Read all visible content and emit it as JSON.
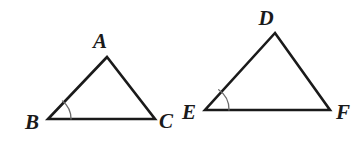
{
  "figure": {
    "background_color": "#ffffff",
    "stroke_color": "#1a1a1a",
    "arc_color": "#666666",
    "stroke_width": 2.6,
    "arc_width": 1.2,
    "shapes": [
      {
        "id": "triangle-abc",
        "name": "triangle-abc",
        "kind": "triangle",
        "points": "107,57 48,119 155,119",
        "vertices": [
          {
            "label": "A",
            "name": "vertex-label-a",
            "x": 107,
            "y": 57,
            "label_x": 100,
            "label_y": 48
          },
          {
            "label": "B",
            "name": "vertex-label-b",
            "x": 48,
            "y": 119,
            "label_x": 25,
            "label_y": 129
          },
          {
            "label": "C",
            "name": "vertex-label-c",
            "x": 155,
            "y": 119,
            "label_x": 159,
            "label_y": 128
          }
        ],
        "angle_mark": {
          "name": "angle-arc-b",
          "at": "B",
          "path": "M 71,119 A 23,23 0 0 0 62.5,101.0"
        }
      },
      {
        "id": "triangle-def",
        "name": "triangle-def",
        "kind": "triangle",
        "points": "275,33 205,110 330,110",
        "vertices": [
          {
            "label": "D",
            "name": "vertex-label-d",
            "x": 275,
            "y": 33,
            "label_x": 266,
            "label_y": 25
          },
          {
            "label": "E",
            "name": "vertex-label-e",
            "x": 205,
            "y": 110,
            "label_x": 182,
            "label_y": 119
          },
          {
            "label": "F",
            "name": "vertex-label-f",
            "x": 330,
            "y": 110,
            "label_x": 336,
            "label_y": 119
          }
        ],
        "angle_mark": {
          "name": "angle-arc-e",
          "at": "E",
          "path": "M 229,110 A 24,24 0 0 0 218.7,89.7"
        }
      }
    ]
  }
}
